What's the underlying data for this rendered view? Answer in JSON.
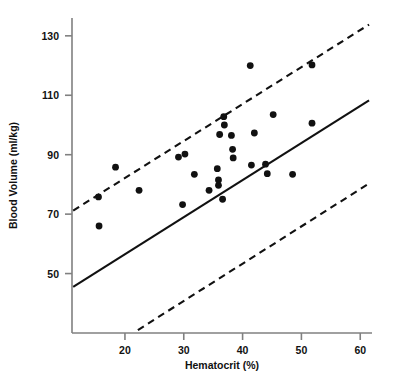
{
  "chart_data": {
    "type": "scatter",
    "title": "",
    "xlabel": "Hematocrit (%)",
    "ylabel": "Blood Volume (ml/kg)",
    "xlim": [
      11,
      62
    ],
    "ylim": [
      30,
      136
    ],
    "xticks": [
      20,
      30,
      40,
      50,
      60
    ],
    "yticks": [
      50,
      70,
      90,
      110,
      130
    ],
    "grid": false,
    "legend": null,
    "points": [
      {
        "x": 15.5,
        "y": 75.8
      },
      {
        "x": 15.6,
        "y": 66.0
      },
      {
        "x": 18.4,
        "y": 85.8
      },
      {
        "x": 22.4,
        "y": 78.0
      },
      {
        "x": 29.1,
        "y": 89.2
      },
      {
        "x": 29.8,
        "y": 73.2
      },
      {
        "x": 30.2,
        "y": 90.2
      },
      {
        "x": 31.8,
        "y": 83.4
      },
      {
        "x": 34.3,
        "y": 78.0
      },
      {
        "x": 35.7,
        "y": 85.3
      },
      {
        "x": 35.9,
        "y": 81.5
      },
      {
        "x": 35.9,
        "y": 79.7
      },
      {
        "x": 36.1,
        "y": 96.8
      },
      {
        "x": 36.6,
        "y": 75.0
      },
      {
        "x": 36.8,
        "y": 102.8
      },
      {
        "x": 36.9,
        "y": 100.0
      },
      {
        "x": 38.1,
        "y": 96.5
      },
      {
        "x": 38.3,
        "y": 91.8
      },
      {
        "x": 38.4,
        "y": 88.9
      },
      {
        "x": 41.3,
        "y": 120.0
      },
      {
        "x": 41.5,
        "y": 86.5
      },
      {
        "x": 42.0,
        "y": 97.3
      },
      {
        "x": 43.9,
        "y": 86.8
      },
      {
        "x": 44.2,
        "y": 83.6
      },
      {
        "x": 45.2,
        "y": 103.5
      },
      {
        "x": 48.5,
        "y": 83.4
      },
      {
        "x": 51.8,
        "y": 120.2
      },
      {
        "x": 51.8,
        "y": 100.6
      }
    ],
    "lines": [
      {
        "name": "regression-line",
        "style": "solid",
        "x": [
          11.2,
          61.5
        ],
        "y": [
          45.5,
          108.3
        ]
      },
      {
        "name": "upper-prediction-limit",
        "style": "dashed",
        "x": [
          11.2,
          61.5
        ],
        "y": [
          71.2,
          133.8
        ]
      },
      {
        "name": "lower-prediction-limit",
        "style": "dashed",
        "x": [
          22.2,
          61.5
        ],
        "y": [
          31.0,
          80.3
        ]
      }
    ],
    "colors": {
      "point": "#111111",
      "line": "#111111",
      "axis": "#808080"
    }
  }
}
